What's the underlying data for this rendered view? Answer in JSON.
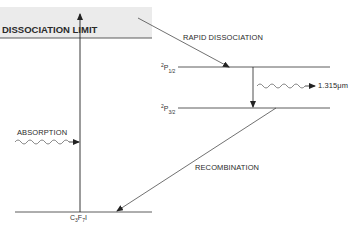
{
  "diagram": {
    "band_color": "#ebebeb",
    "line_color": "#333333",
    "labels": {
      "dissociation_limit": "DISSOCIATION LIMIT",
      "rapid_dissociation": "RAPID DISSOCIATION",
      "absorption": "ABSORPTION",
      "recombination": "RECOMBINATION",
      "emission_wavelength": "1.315μm"
    },
    "states": {
      "upper": {
        "sup": "2",
        "base": "P",
        "sub": "1/2"
      },
      "lower": {
        "sup": "2",
        "base": "P",
        "sub": "3/2"
      },
      "ground": {
        "text_parts": [
          "C",
          "3",
          "F",
          "7",
          "I"
        ]
      }
    }
  }
}
